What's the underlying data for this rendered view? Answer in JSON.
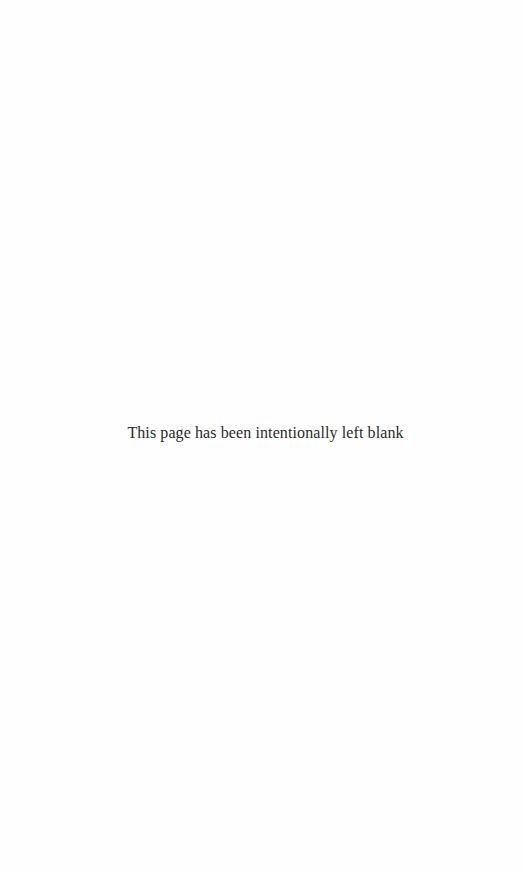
{
  "page": {
    "background_color": "#fefefe",
    "text_color": "#2b2b2b",
    "notice_text": "This page has been intentionally left blank"
  }
}
